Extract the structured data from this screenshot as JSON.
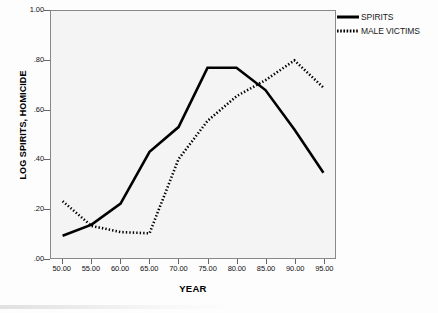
{
  "chart_data": {
    "type": "line",
    "title": "",
    "xlabel": "YEAR",
    "ylabel": "LOG SPIRITS, HOMICIDE",
    "x": [
      50,
      55,
      60,
      65,
      70,
      75,
      80,
      85,
      90,
      95
    ],
    "xtick_labels": [
      "50.00",
      "55.00",
      "60.00",
      "65.00",
      "70.00",
      "75.00",
      "80.00",
      "85.00",
      "90.00",
      "95.00"
    ],
    "ytick_labels": [
      "1.00",
      ".80",
      ".60",
      ".40",
      ".20",
      ".00"
    ],
    "ytick_values": [
      1.0,
      0.8,
      0.6,
      0.4,
      0.2,
      0.0
    ],
    "xlim": [
      48,
      97
    ],
    "ylim": [
      0.0,
      1.0
    ],
    "grid": false,
    "legend_position": "right-top",
    "series": [
      {
        "name": "SPIRITS",
        "style": "solid",
        "color": "#000000",
        "values": [
          0.09,
          0.135,
          0.22,
          0.43,
          0.53,
          0.77,
          0.77,
          0.68,
          0.52,
          0.345
        ]
      },
      {
        "name": "MALE VICTIMS",
        "style": "dotted",
        "color": "#000000",
        "values": [
          0.23,
          0.13,
          0.105,
          0.1,
          0.4,
          0.555,
          0.655,
          0.72,
          0.8,
          0.69
        ]
      }
    ]
  },
  "legend": {
    "items": [
      {
        "label": "SPIRITS",
        "style": "solid"
      },
      {
        "label": "MALE VICTIMS",
        "style": "dotted"
      }
    ]
  }
}
